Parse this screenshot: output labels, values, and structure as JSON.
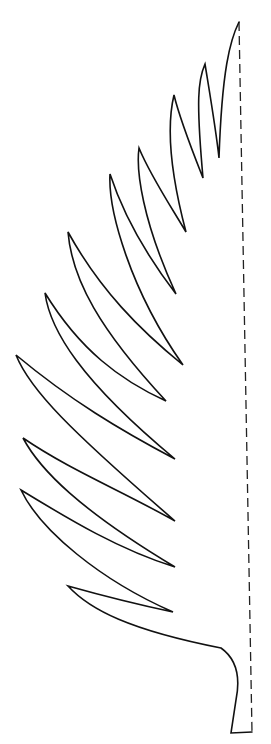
{
  "figure": {
    "colors": {
      "background": "#ffffff",
      "outline": "#111111",
      "fold_line": "#222222"
    },
    "fold_line": {
      "style": "dashed",
      "from": [
        239,
        22
      ],
      "to": [
        252,
        732
      ]
    },
    "leaflet_count": 10
  }
}
